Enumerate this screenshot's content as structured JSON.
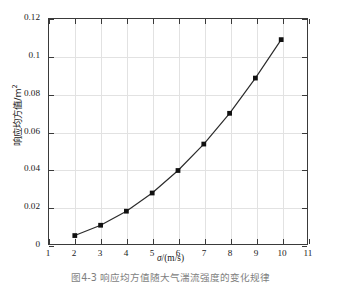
{
  "figure": {
    "caption": "图4-3  响应均方值随大气湍流强度的变化规律"
  },
  "chart_data": {
    "type": "line",
    "title": "",
    "xlabel": "σ/(m/s)",
    "ylabel": "响应均方值/m²",
    "ylabel_text": "响应均方值/m",
    "ylabel_sup": "2",
    "xlim": [
      1,
      11
    ],
    "ylim": [
      0,
      0.12
    ],
    "grid": true,
    "legend": null,
    "marker": "filled-square",
    "line_color": "#2b2b2b",
    "marker_color": "#111111",
    "grid_color": "#e2e2e2",
    "axis_color": "#3a3a3a",
    "xticks": [
      1,
      2,
      3,
      4,
      5,
      6,
      7,
      8,
      9,
      10,
      11
    ],
    "xtick_labels": [
      "1",
      "2",
      "3",
      "4",
      "5",
      "6",
      "7",
      "8",
      "9",
      "10",
      "11"
    ],
    "yticks": [
      0,
      0.02,
      0.04,
      0.06,
      0.08,
      0.1,
      0.12
    ],
    "ytick_labels": [
      "0",
      "0.02",
      "0.04",
      "0.06",
      "0.08",
      "0.1",
      "0.12"
    ],
    "x": [
      2,
      3,
      4,
      5,
      6,
      7,
      8,
      9,
      10
    ],
    "values": [
      0.0045,
      0.01,
      0.0175,
      0.0272,
      0.0392,
      0.0533,
      0.0697,
      0.0885,
      0.109
    ],
    "series": [
      {
        "name": "响应均方值",
        "x": [
          2,
          3,
          4,
          5,
          6,
          7,
          8,
          9,
          10
        ],
        "values": [
          0.0045,
          0.01,
          0.0175,
          0.0272,
          0.0392,
          0.0533,
          0.0697,
          0.0885,
          0.109
        ]
      }
    ]
  }
}
